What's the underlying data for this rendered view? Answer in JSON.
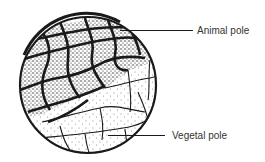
{
  "diagram": {
    "labels": {
      "animal_pole": "Animal pole",
      "vegetal_pole": "Vegetal pole"
    },
    "colors": {
      "ink": "#1a1a1a",
      "label_text": "#333333",
      "background": "#ffffff"
    }
  }
}
